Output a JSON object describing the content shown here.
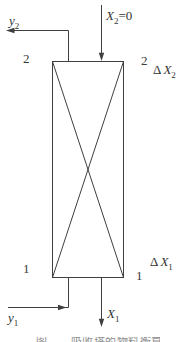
{
  "diagram": {
    "colors": {
      "background": "#ffffff",
      "line": "#3f3f3f",
      "text": "#333333",
      "caption": "#909090"
    },
    "streams": {
      "gas_out_top": {
        "base": "y",
        "sub": "2"
      },
      "liquid_in_top": {
        "base": "X",
        "sub": "2",
        "suffix": "=0"
      },
      "gas_in_bottom": {
        "base": "y",
        "sub": "1"
      },
      "liquid_out_bottom": {
        "base": "X",
        "sub": "1"
      }
    },
    "section_marks": {
      "top_left": "2",
      "top_right": "2",
      "bottom_left": "1",
      "bottom_right": "1"
    },
    "deltas": {
      "top": {
        "prefix": "Δ",
        "base": "X",
        "sub": "2"
      },
      "bottom": {
        "prefix": "Δ",
        "base": "X",
        "sub": "1"
      }
    },
    "caption_clipped": "图　　吸收塔的物料衡算"
  }
}
